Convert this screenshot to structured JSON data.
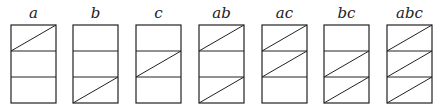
{
  "diagram": {
    "rows": [
      "a",
      "c",
      "b"
    ],
    "colors": {
      "stroke": "#222222",
      "background": "#ffffff"
    },
    "panels": [
      {
        "label": "a",
        "x": 11,
        "diagonals": [
          true,
          false,
          false
        ]
      },
      {
        "label": "b",
        "x": 73,
        "diagonals": [
          false,
          false,
          true
        ]
      },
      {
        "label": "c",
        "x": 136,
        "diagonals": [
          false,
          true,
          false
        ]
      },
      {
        "label": "ab",
        "x": 199,
        "diagonals": [
          true,
          false,
          true
        ]
      },
      {
        "label": "ac",
        "x": 262,
        "diagonals": [
          true,
          true,
          false
        ]
      },
      {
        "label": "bc",
        "x": 324,
        "diagonals": [
          false,
          true,
          true
        ]
      },
      {
        "label": "abc",
        "x": 387,
        "diagonals": [
          true,
          true,
          true
        ]
      }
    ],
    "geometry": {
      "top": 25,
      "width": 45,
      "cell_height": 26,
      "label_y": 18
    }
  }
}
